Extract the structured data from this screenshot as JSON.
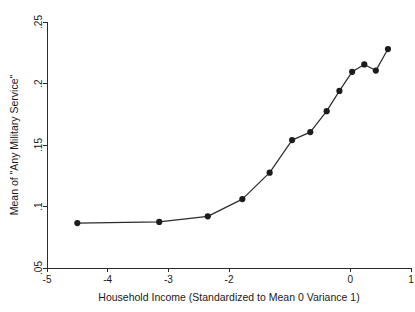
{
  "chart_data": {
    "type": "line",
    "title": "",
    "subtitle": "",
    "xlabel": "Household Income (Standardized to Mean 0 Variance 1)",
    "ylabel": "Mean of \"Any Military Service\"",
    "xlim": [
      -5,
      1
    ],
    "ylim": [
      0.05,
      0.25
    ],
    "grid": false,
    "legend": null,
    "legend_position": "none",
    "marker": "filled-circle",
    "line_style": "solid",
    "color": "#1c1c1c",
    "xticks": [
      -5,
      -4,
      -3,
      -2,
      -1,
      0,
      1
    ],
    "xtick_labels": [
      "-5",
      "-4",
      "-3",
      "-2",
      "",
      "0",
      "1"
    ],
    "yticks": [
      0.05,
      0.1,
      0.15,
      0.2,
      0.25
    ],
    "ytick_labels": [
      ".05",
      ".1",
      ".15",
      ".2",
      ".25"
    ],
    "x": [
      -4.5,
      -3.15,
      -2.35,
      -1.78,
      -1.33,
      -0.96,
      -0.66,
      -0.39,
      -0.18,
      0.03,
      0.23,
      0.42,
      0.62
    ],
    "values": [
      0.0865,
      0.0875,
      0.092,
      0.106,
      0.1275,
      0.154,
      0.1605,
      0.1775,
      0.194,
      0.2095,
      0.2155,
      0.2105,
      0.228
    ],
    "series": [
      {
        "name": "Mean of \"Any Military Service\"",
        "points": [
          {
            "x": -4.5,
            "y": 0.0865
          },
          {
            "x": -3.15,
            "y": 0.0875
          },
          {
            "x": -2.35,
            "y": 0.092
          },
          {
            "x": -1.78,
            "y": 0.106
          },
          {
            "x": -1.33,
            "y": 0.1275
          },
          {
            "x": -0.96,
            "y": 0.154
          },
          {
            "x": -0.66,
            "y": 0.1605
          },
          {
            "x": -0.39,
            "y": 0.1775
          },
          {
            "x": -0.18,
            "y": 0.194
          },
          {
            "x": 0.03,
            "y": 0.2095
          },
          {
            "x": 0.23,
            "y": 0.2155
          },
          {
            "x": 0.42,
            "y": 0.2105
          },
          {
            "x": 0.62,
            "y": 0.228
          }
        ]
      }
    ]
  }
}
